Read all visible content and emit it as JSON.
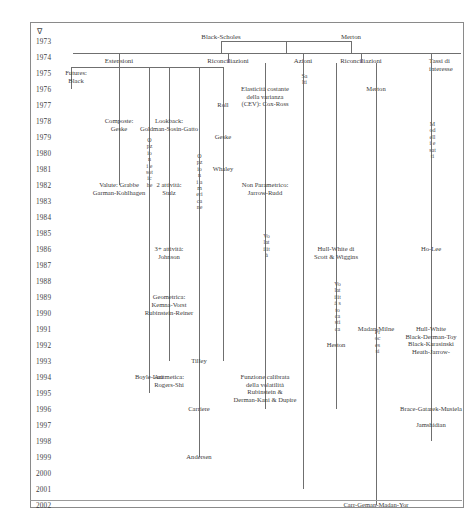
{
  "diagram": {
    "title_marker": "∇",
    "language": "it",
    "years": [
      "1973",
      "1974",
      "1975",
      "1976",
      "1977",
      "1978",
      "1979",
      "1980",
      "1981",
      "1982",
      "1983",
      "1984",
      "1985",
      "1986",
      "1987",
      "1988",
      "1989",
      "1990",
      "1991",
      "1992",
      "1993",
      "1994",
      "1995",
      "1996",
      "1997",
      "1998",
      "1999",
      "2000",
      "2001",
      "2002"
    ],
    "root": {
      "left_label": "Black-Scholes",
      "right_label": "Merton"
    },
    "categories": [
      {
        "name": "estensioni",
        "label": "Estensioni"
      },
      {
        "name": "riconciliazioni-1",
        "label": "Riconciliazioni"
      },
      {
        "name": "azioni",
        "label": "Azioni"
      },
      {
        "name": "riconciliazioni-2",
        "label": "Riconciliazioni"
      },
      {
        "name": "tassi-di-interesse",
        "label": "Tassi di\ninteresse"
      }
    ],
    "vertical_labels": [
      {
        "name": "opzioni-esotiche",
        "text": "Opzioni esotiche"
      },
      {
        "name": "opzioni-americane",
        "text": "Opzioni americane"
      },
      {
        "name": "volatilita",
        "text": "Volatilità"
      },
      {
        "name": "salti",
        "text": "Salti"
      },
      {
        "name": "volatilita-stocastica",
        "text": "Volatilità stocastica"
      },
      {
        "name": "processi",
        "text": "Processi"
      },
      {
        "name": "modelli-esatti",
        "text": "Modelli esatti"
      }
    ],
    "nodes": [
      {
        "name": "futures-black",
        "text": "Futures:\nBlack",
        "year": "1975"
      },
      {
        "name": "composte-geske",
        "text": "Composte:\nGeske",
        "year": "1978"
      },
      {
        "name": "valute-grabbe",
        "text": "Valute: Grabbe\nGarman-Kohlhagen",
        "year": "1982"
      },
      {
        "name": "lookback-goldman",
        "text": "Lookback:\nGoldman-Sosin-Gatto",
        "year": "1978"
      },
      {
        "name": "due-attivita-stulz",
        "text": "2 attività:\nStulz",
        "year": "1982"
      },
      {
        "name": "tre-attivita-johnson",
        "text": "3+ attività:\nJohnson",
        "year": "1986"
      },
      {
        "name": "geometrica-kemna-vorst",
        "text": "Geometrica:\nKemna-Vorst",
        "year": "1989"
      },
      {
        "name": "roll",
        "text": "Roll",
        "year": "1977"
      },
      {
        "name": "geske",
        "text": "Geske",
        "year": "1979"
      },
      {
        "name": "whaley",
        "text": "Whaley",
        "year": "1981"
      },
      {
        "name": "rubinstein-reiner",
        "text": "Rubinstein-Reiner",
        "year": "1990"
      },
      {
        "name": "boyle-lau",
        "text": "Boyle-Lau",
        "year": "1994"
      },
      {
        "name": "tilley",
        "text": "Tilley",
        "year": "1993"
      },
      {
        "name": "aritmetica-rogers-shi",
        "text": "Aritmetica:\nRogers-Shi",
        "year": "1994"
      },
      {
        "name": "carriere",
        "text": "Carriere",
        "year": "1996"
      },
      {
        "name": "andersen",
        "text": "Andersen",
        "year": "1999"
      },
      {
        "name": "cev-cox-ross",
        "text": "Elasticità costante\ndella varianza\n(CEV): Cox-Ross",
        "year": "1976"
      },
      {
        "name": "non-parametrico-jarrow-rudd",
        "text": "Non Parametrico:\nJarrow-Rudd",
        "year": "1982"
      },
      {
        "name": "funzione-calibrata",
        "text": "Funzione calibrata\ndella volatilità\nRubinstein &\nDerman-Kani & Dupire",
        "year": "1994"
      },
      {
        "name": "hull-white-scott-wiggins",
        "text": "Hull-White di\nScott & Wiggins",
        "year": "1986"
      },
      {
        "name": "heston",
        "text": "Heston",
        "year": "1992"
      },
      {
        "name": "merton",
        "text": "Merton",
        "year": "1976"
      },
      {
        "name": "madan-milne",
        "text": "Madan-Milne",
        "year": "1991"
      },
      {
        "name": "carr-geman-madan-yor",
        "text": "Carr-Geman-Madan-Yor",
        "year": "2002"
      },
      {
        "name": "ho-lee",
        "text": "Ho-Lee",
        "year": "1986"
      },
      {
        "name": "hull-white-bdt",
        "text": "Hull-White\nBlack-Derman-Toy\nBlack-Karasinski\nHeath-Jarrow-",
        "year": "1991"
      },
      {
        "name": "brace-gatarek-musiela",
        "text": "Brace-Gatarek-Musiela",
        "year": "1996"
      },
      {
        "name": "jamshidian",
        "text": "Jamshidian",
        "year": "1997"
      }
    ]
  }
}
